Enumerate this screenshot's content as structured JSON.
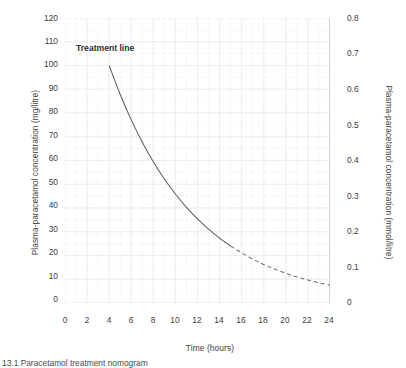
{
  "figure": {
    "caption": "13.1 Paracetamol treatment nomogram"
  },
  "annotations": {
    "treatment_line": "Treatment line"
  },
  "axes": {
    "x": {
      "title": "Time (hours)",
      "ticks": [
        "0",
        "2",
        "4",
        "6",
        "8",
        "10",
        "12",
        "14",
        "16",
        "18",
        "20",
        "22",
        "24"
      ]
    },
    "y_left": {
      "title": "Plasma-paracetamol concentration (mg/litre)",
      "ticks": [
        "120",
        "110",
        "100",
        "90",
        "80",
        "70",
        "60",
        "50",
        "40",
        "30",
        "20",
        "10",
        "0"
      ]
    },
    "y_right": {
      "title": "Plasma-paracetamol concentration (mmol/litre)",
      "ticks": [
        "0.8",
        "0.7",
        "0.6",
        "0.5",
        "0.4",
        "0.3",
        "0.2",
        "0.1",
        "0"
      ]
    }
  },
  "colors": {
    "line": "#5a5a5a",
    "grid": "#eceef1",
    "axis": "#8a8a8a",
    "text": "#3d3d3d",
    "background": "#ffffff"
  },
  "chart_data": {
    "type": "line",
    "title": "",
    "xlabel": "Time (hours)",
    "ylabel": "Plasma-paracetamol concentration (mg/litre)",
    "ylabel_secondary": "Plasma-paracetamol concentration (mmol/litre)",
    "xlim": [
      0,
      24
    ],
    "ylim": [
      0,
      120
    ],
    "ylim_secondary": [
      0,
      0.8
    ],
    "grid": true,
    "legend": "none",
    "xticks": [
      0,
      2,
      4,
      6,
      8,
      10,
      12,
      14,
      16,
      18,
      20,
      22,
      24
    ],
    "yticks": [
      0,
      10,
      20,
      30,
      40,
      50,
      60,
      70,
      80,
      90,
      100,
      110,
      120
    ],
    "yticks_secondary": [
      0,
      0.1,
      0.2,
      0.3,
      0.4,
      0.5,
      0.6,
      0.7,
      0.8
    ],
    "minor_grid_x_step": 1,
    "minor_grid_y_step": 5,
    "series": [
      {
        "name": "Treatment line",
        "style": "solid-then-dashed",
        "dash_starts_at_x": 15,
        "x": [
          4,
          5,
          6,
          7,
          8,
          9,
          10,
          11,
          12,
          13,
          14,
          15,
          16,
          17,
          18,
          19,
          20,
          21,
          22,
          23,
          24
        ],
        "y": [
          100,
          87.8,
          77.1,
          67.7,
          59.5,
          52.2,
          45.9,
          40.3,
          35.4,
          31.1,
          27.3,
          24.0,
          21.1,
          18.5,
          16.2,
          14.3,
          12.5,
          11.0,
          9.7,
          8.5,
          7.5
        ],
        "y_secondary": [
          0.667,
          0.585,
          0.514,
          0.451,
          0.397,
          0.348,
          0.306,
          0.269,
          0.236,
          0.207,
          0.182,
          0.16,
          0.141,
          0.123,
          0.108,
          0.095,
          0.084,
          0.073,
          0.065,
          0.057,
          0.05
        ]
      }
    ],
    "annotations": [
      {
        "text": "Treatment line",
        "x": 5.3,
        "y": 112
      }
    ]
  }
}
